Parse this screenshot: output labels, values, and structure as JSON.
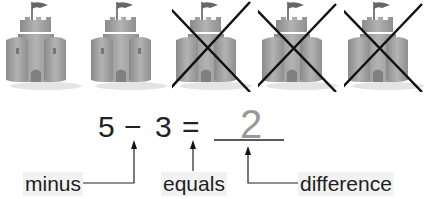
{
  "castles": [
    {
      "id": 1,
      "crossed": false
    },
    {
      "id": 2,
      "crossed": false
    },
    {
      "id": 3,
      "crossed": true
    },
    {
      "id": 4,
      "crossed": true
    },
    {
      "id": 5,
      "crossed": true
    }
  ],
  "equation": {
    "minuend": "5",
    "operator": "−",
    "subtrahend": "3",
    "equals": "=",
    "answer": "2"
  },
  "labels": {
    "minus": "minus",
    "equals": "equals",
    "difference": "difference"
  },
  "colors": {
    "castle": "#9a9a9a",
    "cross": "#111111",
    "answer": "#999999"
  }
}
